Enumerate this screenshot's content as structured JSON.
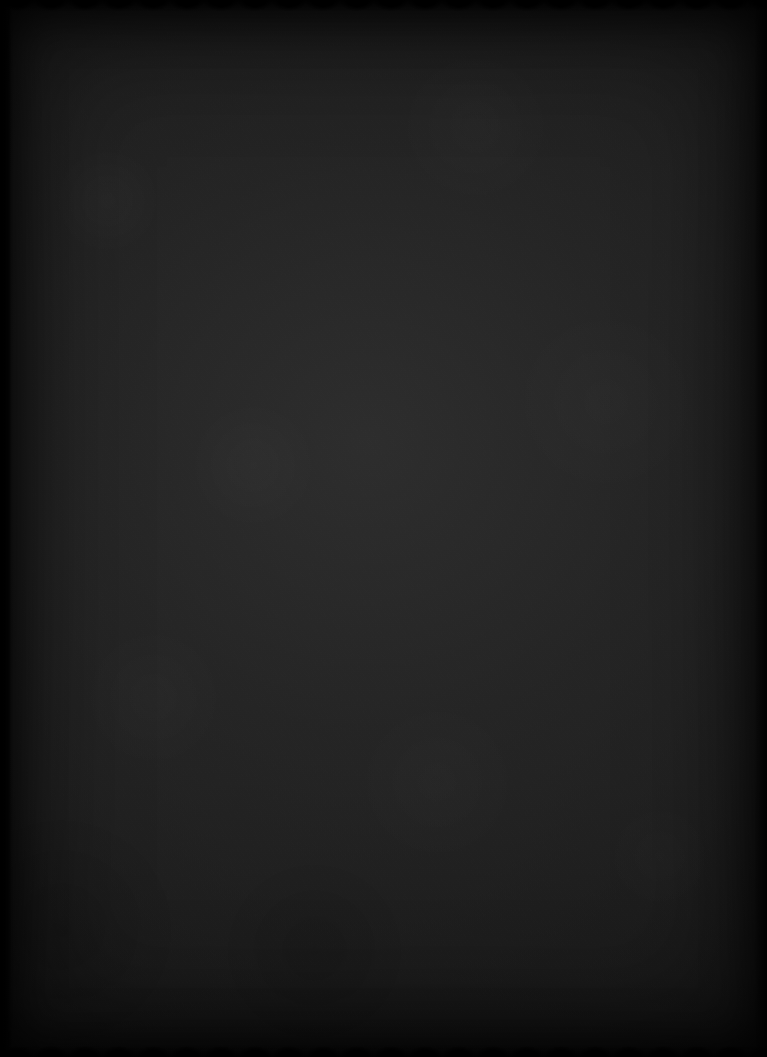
{
  "document": {
    "kind": "scanned-ruled-notebook-page",
    "description": "Dark scan of a blank lined notebook sheet",
    "visible_text": "",
    "width_px": 767,
    "height_px": 1057
  },
  "paper": {
    "background_color": "#1f1f1f",
    "darkest_color": "#0b0b0b",
    "lightest_color": "#2c2c2c",
    "texture": "fibrous paper grain with scanner noise"
  },
  "ruling": {
    "line_color": "#b4b4b4",
    "line_thickness_px": 2,
    "line_spacing_px": 30,
    "first_line_y_px": 48,
    "line_count": 33,
    "line_start_x_px": 8,
    "line_end_x_px": 755,
    "lines_y": [
      48,
      78,
      108,
      138,
      168,
      198,
      228,
      258,
      288,
      318,
      348,
      378,
      408,
      438,
      468,
      498,
      528,
      558,
      588,
      618,
      648,
      678,
      708,
      738,
      768,
      798,
      828,
      858,
      888,
      918,
      948,
      983,
      1013
    ]
  },
  "edges": {
    "top_edge": "scalloped-deckle",
    "bottom_edge": "scalloped-deckle",
    "left_edge": "notched-perforated-strip",
    "right_edge": "straight-dark-margin",
    "left_strip_width_px": 11,
    "notch_positions_y": [
      62,
      96,
      132,
      176,
      214,
      262,
      300,
      342,
      396,
      436,
      486,
      532,
      576,
      628,
      672,
      716,
      770,
      824,
      874,
      928,
      982,
      1020
    ]
  },
  "vignette": {
    "present": true,
    "color": "#000000"
  }
}
